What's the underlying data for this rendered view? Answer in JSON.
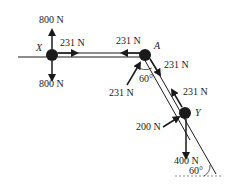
{
  "diagram": {
    "type": "free-body force diagram",
    "colors": {
      "ink": "#1a1a1a",
      "background": "#ffffff"
    },
    "points": {
      "X": {
        "label": "X",
        "forces": {
          "up": "800 N",
          "down": "800 N",
          "right": "231 N"
        }
      },
      "A": {
        "label": "A",
        "forces": {
          "left": "231 N",
          "down_slope": "231 N",
          "push": "231 N"
        },
        "angle": "60°"
      },
      "Y": {
        "label": "Y",
        "forces": {
          "up_slope": "231 N",
          "push": "200 N",
          "down": "400 N"
        }
      }
    },
    "incline_angle": "60°"
  }
}
